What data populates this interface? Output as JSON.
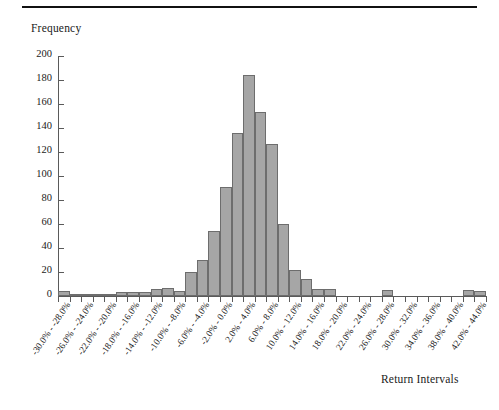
{
  "figure": {
    "y_axis_title": "Frequency",
    "x_axis_title": "Return Intervals"
  },
  "chart_data": {
    "type": "bar",
    "title": "",
    "subtitle": "",
    "xlabel": "Return Intervals",
    "ylabel": "Frequency",
    "ylim": [
      0,
      200
    ],
    "ytick_values": [
      0,
      20,
      40,
      60,
      80,
      100,
      120,
      140,
      160,
      180,
      200
    ],
    "ytick_labels": [
      "0",
      "20",
      "40",
      "60",
      "80",
      "100",
      "120",
      "140",
      "160",
      "180",
      "200"
    ],
    "grid": false,
    "legend": "none",
    "bin_width_percent": 2,
    "bin_edges_percent": [
      -30,
      -28,
      -26,
      -24,
      -22,
      -20,
      -18,
      -16,
      -14,
      -12,
      -10,
      -8,
      -6,
      -4,
      -2,
      0,
      2,
      4,
      6,
      8,
      10,
      12,
      14,
      16,
      18,
      20,
      22,
      24,
      26,
      28,
      30,
      32,
      34,
      36,
      38,
      40,
      42,
      44
    ],
    "categories": [
      "-30.0% - -28.0%",
      "-28.0% - -26.0%",
      "-26.0% - -24.0%",
      "-24.0% - -22.0%",
      "-22.0% - -20.0%",
      "-20.0% - -18.0%",
      "-18.0% - -16.0%",
      "-16.0% - -14.0%",
      "-14.0% - -12.0%",
      "-12.0% - -10.0%",
      "-10.0% - -8.0%",
      "-8.0% - -6.0%",
      "-6.0% - -4.0%",
      "-4.0% - -2.0%",
      "-2.0% - 0.0%",
      "0.0% - 2.0%",
      "2.0% - 4.0%",
      "4.0% - 6.0%",
      "6.0% - 8.0%",
      "8.0% - 10.0%",
      "10.0% - 12.0%",
      "12.0% - 14.0%",
      "14.0% - 16.0%",
      "16.0% - 18.0%",
      "18.0% - 20.0%",
      "20.0% - 22.0%",
      "22.0% - 24.0%",
      "24.0% - 26.0%",
      "26.0% - 28.0%",
      "28.0% - 30.0%",
      "30.0% - 32.0%",
      "32.0% - 34.0%",
      "34.0% - 36.0%",
      "36.0% - 38.0%",
      "38.0% - 40.0%",
      "40.0% - 42.0%",
      "42.0% - 44.0%"
    ],
    "values": [
      4,
      1,
      2,
      2,
      2,
      3,
      3,
      3,
      6,
      7,
      4,
      20,
      30,
      54,
      91,
      136,
      184,
      153,
      127,
      60,
      22,
      14,
      6,
      6,
      0,
      0,
      0,
      0,
      5,
      0,
      0,
      0,
      0,
      0,
      0,
      5,
      4
    ],
    "visible_xtick_labels": [
      "-30.0% - -28.0%",
      "-26.0% - -24.0%",
      "-22.0% - -20.0%",
      "-18.0% - -16.0%",
      "-14.0% - -12.0%",
      "-10.0% - -8.0%",
      "-6.0% - -4.0%",
      "-2.0% - 0.0%",
      "2.0% - 4.0%",
      "6.0% - 8.0%",
      "10.0% - 12.0%",
      "14.0% - 16.0%",
      "18.0% - 20.0%",
      "22.0% - 24.0%",
      "26.0% - 28.0%",
      "30.0% - 32.0%",
      "34.0% - 36.0%",
      "38.0% - 40.0%",
      "42.0% - 44.0%"
    ],
    "colors": {
      "bar_fill": "#a6a6a6",
      "bar_edge": "#6d6d6d",
      "axis": "#5a5a5a",
      "text": "#222222",
      "background": "#ffffff",
      "top_rule": "#111111"
    }
  }
}
